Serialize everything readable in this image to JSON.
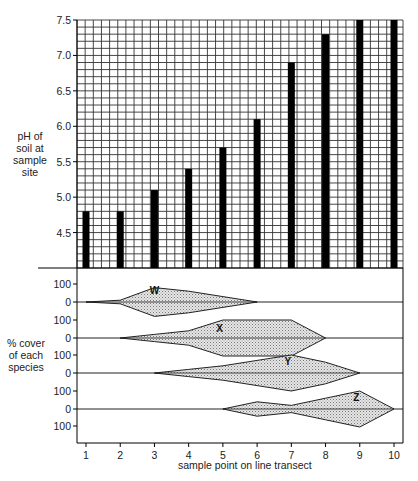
{
  "chart_data": [
    {
      "type": "bar",
      "title": "",
      "ylabel": "pH of soil at sample site",
      "xlabel": "sample point on line transect",
      "categories": [
        "1",
        "2",
        "3",
        "4",
        "5",
        "6",
        "7",
        "8",
        "9",
        "10"
      ],
      "values": [
        4.8,
        4.8,
        5.1,
        5.4,
        5.7,
        6.1,
        6.9,
        7.3,
        7.5,
        7.5
      ],
      "ylim": [
        4.0,
        7.5
      ],
      "yticks": [
        4.5,
        5.0,
        5.5,
        6.0,
        6.5,
        7.0,
        7.5
      ],
      "grid": true
    },
    {
      "type": "area",
      "subtype": "kite diagram",
      "ylabel": "% cover of each species",
      "xlabel": "sample point on line transect",
      "x": [
        1,
        2,
        3,
        4,
        5,
        6,
        7,
        8,
        9,
        10
      ],
      "ytick_labels": [
        "100",
        "0",
        "100",
        "0",
        "100",
        "0",
        "100",
        "0",
        "100"
      ],
      "series": [
        {
          "name": "W",
          "values": [
            0,
            10,
            80,
            60,
            30,
            0,
            0,
            0,
            0,
            0
          ]
        },
        {
          "name": "X",
          "values": [
            0,
            0,
            20,
            40,
            100,
            100,
            100,
            0,
            0,
            0
          ]
        },
        {
          "name": "Y",
          "values": [
            0,
            0,
            0,
            20,
            40,
            70,
            100,
            60,
            0,
            0
          ]
        },
        {
          "name": "Z",
          "values": [
            0,
            0,
            0,
            0,
            0,
            40,
            20,
            60,
            100,
            0
          ]
        }
      ]
    }
  ],
  "labels": {
    "y_upper": [
      "pH of",
      "soil at",
      "sample",
      "site"
    ],
    "y_lower": [
      "% cover",
      "of each",
      "species"
    ],
    "x_title": "sample point on line transect",
    "x_ticks": [
      "1",
      "2",
      "3",
      "4",
      "5",
      "6",
      "7",
      "8",
      "9",
      "10"
    ],
    "upper_yticks": [
      "7.5",
      "7.0",
      "6.5",
      "6.0",
      "5.5",
      "5.0",
      "4.5"
    ],
    "lower_yticks": [
      "100",
      "0",
      "100",
      "0",
      "100",
      "0",
      "100",
      "0",
      "100"
    ],
    "species": [
      "W",
      "X",
      "Y",
      "Z"
    ]
  }
}
